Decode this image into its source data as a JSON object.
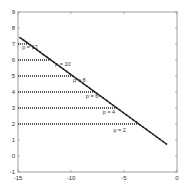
{
  "chart_data": {
    "type": "line",
    "title": "",
    "xlabel": "",
    "ylabel": "",
    "xlim": [
      -15,
      0
    ],
    "ylim": [
      -1,
      9
    ],
    "grid": false,
    "x_ticks": [
      -15,
      -10,
      -5,
      0
    ],
    "y_ticks": [
      -1,
      0,
      1,
      2,
      3,
      4,
      5,
      6,
      7,
      8,
      9
    ],
    "series": [
      {
        "name": "diagonal",
        "style": "solid with dot markers",
        "x": [
          -14.8,
          -1.0
        ],
        "y": [
          7.4,
          0.75
        ]
      },
      {
        "name": "p = 12",
        "style": "dotted",
        "x": [
          -15,
          -14.0
        ],
        "y": [
          7,
          7
        ]
      },
      {
        "name": "p = 10",
        "style": "dotted",
        "x": [
          -15,
          -11.9
        ],
        "y": [
          6,
          6
        ]
      },
      {
        "name": "p = 8",
        "style": "dotted",
        "x": [
          -15,
          -9.8
        ],
        "y": [
          5,
          5
        ]
      },
      {
        "name": "p = 6",
        "style": "dotted",
        "x": [
          -15,
          -7.7
        ],
        "y": [
          4,
          4
        ]
      },
      {
        "name": "p = 4",
        "style": "dotted",
        "x": [
          -15,
          -5.7
        ],
        "y": [
          3,
          3
        ]
      },
      {
        "name": "p = 2",
        "style": "dotted",
        "x": [
          -15,
          -3.6
        ],
        "y": [
          2,
          2
        ]
      }
    ],
    "annotations": [
      {
        "text": "p = 12",
        "x": -14.6,
        "y": 6.7
      },
      {
        "text": "p = 10",
        "x": -11.5,
        "y": 5.6
      },
      {
        "text": "p = 8",
        "x": -9.8,
        "y": 4.6
      },
      {
        "text": "p = 6",
        "x": -8.6,
        "y": 3.6
      },
      {
        "text": "p = 4",
        "x": -7.0,
        "y": 2.6
      },
      {
        "text": "p = 2",
        "x": -6.0,
        "y": 1.5
      }
    ]
  },
  "axes": {
    "x_tick_labels": [
      "-15",
      "-10",
      "-5",
      "0"
    ],
    "y_tick_labels": [
      "-1",
      "0",
      "1",
      "2",
      "3",
      "4",
      "5",
      "6",
      "7",
      "8",
      "9"
    ]
  },
  "colors": {
    "axis": "#888888",
    "line": "#222222",
    "text": "#333333"
  }
}
